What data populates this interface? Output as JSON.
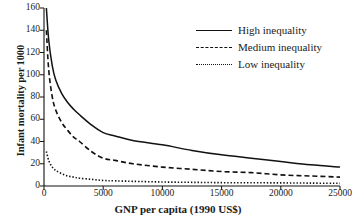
{
  "chart_data": {
    "type": "line",
    "title": "",
    "xlabel": "GNP per capita (1990 US$)",
    "ylabel": "Infant mortality per 1000",
    "xlim": [
      0,
      25000
    ],
    "ylim": [
      0,
      160
    ],
    "xticks": [
      0,
      5000,
      10000,
      15000,
      20000,
      25000
    ],
    "yticks": [
      0,
      20,
      40,
      60,
      80,
      100,
      120,
      140,
      160
    ],
    "xtick_labels": [
      "0",
      "5000",
      "10000",
      "15000",
      "20000",
      "25000"
    ],
    "ytick_labels": [
      "0",
      "20",
      "40",
      "60",
      "80",
      "100",
      "120",
      "140",
      "160"
    ],
    "grid": false,
    "legend_position": "upper right",
    "line_color": "#111111",
    "x": [
      200,
      400,
      700,
      1000,
      1500,
      2000,
      2500,
      3000,
      4000,
      5000,
      6000,
      7500,
      10000,
      12500,
      15000,
      17500,
      20000,
      22500,
      25000
    ],
    "series": [
      {
        "name": "High inequality",
        "style": "solid",
        "values": [
          160,
          131,
          108,
          95,
          83,
          75,
          69,
          64,
          55,
          48,
          45,
          41,
          37,
          32,
          28,
          25,
          22,
          19,
          17
        ]
      },
      {
        "name": "Medium inequality",
        "style": "dashed",
        "values": [
          140,
          104,
          80,
          68,
          57,
          50,
          44,
          40,
          31,
          25,
          23,
          20,
          17,
          15,
          13,
          12,
          10,
          9,
          8
        ]
      },
      {
        "name": "Low inequality",
        "style": "dotted",
        "values": [
          31,
          23,
          17,
          14,
          11,
          9,
          8,
          7,
          6,
          5,
          4.6,
          4.2,
          3.6,
          3.3,
          3.0,
          2.9,
          2.8,
          2.6,
          2.4
        ]
      }
    ]
  },
  "legend": {
    "items": [
      {
        "label": "High inequality",
        "style": "solid"
      },
      {
        "label": "Medium inequality",
        "style": "dashed"
      },
      {
        "label": "Low inequality",
        "style": "dotted"
      }
    ]
  },
  "axes": {
    "x_title": "GNP per capita (1990 US$)",
    "y_title": "Infant mortality per 1000"
  }
}
